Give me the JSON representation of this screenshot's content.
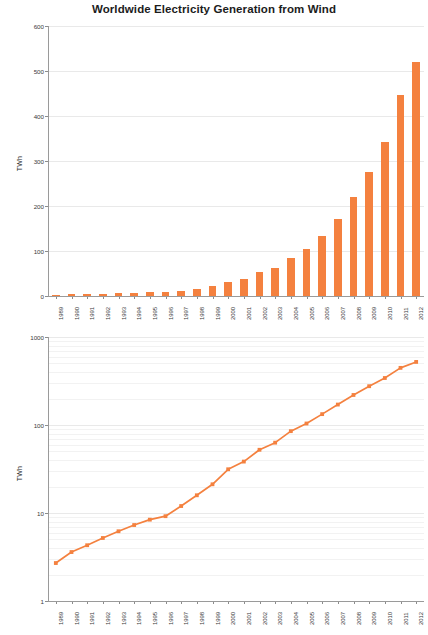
{
  "title": "Worldwide Electricity Generation from Wind",
  "colors": {
    "series": "#f4813f",
    "grid": "#e9e9e9",
    "axis": "#9a9a9a",
    "text": "#2a2a2a"
  },
  "chart_data": [
    {
      "type": "bar",
      "title": "Worldwide Electricity Generation from Wind",
      "xlabel": "",
      "ylabel": "TWh",
      "categories": [
        "1989",
        "1990",
        "1991",
        "1992",
        "1993",
        "1994",
        "1995",
        "1996",
        "1997",
        "1998",
        "1999",
        "2000",
        "2001",
        "2002",
        "2003",
        "2004",
        "2005",
        "2006",
        "2007",
        "2008",
        "2009",
        "2010",
        "2011",
        "2012"
      ],
      "values": [
        2.7,
        3.6,
        4.3,
        5.2,
        6.2,
        7.3,
        8.4,
        9.2,
        12.0,
        15.9,
        21.2,
        31.4,
        38.4,
        52.3,
        63.0,
        85.1,
        104.0,
        132.9,
        170.7,
        219.4,
        276.0,
        342.0,
        446.0,
        521.0
      ],
      "ylim": [
        0,
        600
      ],
      "yticks": [
        0,
        100,
        200,
        300,
        400,
        500,
        600
      ],
      "grid": true,
      "legend": "none",
      "yscale": "linear"
    },
    {
      "type": "line",
      "title": "",
      "xlabel": "",
      "ylabel": "TWh",
      "categories": [
        "1989",
        "1990",
        "1991",
        "1992",
        "1993",
        "1994",
        "1995",
        "1996",
        "1997",
        "1998",
        "1999",
        "2000",
        "2001",
        "2002",
        "2003",
        "2004",
        "2005",
        "2006",
        "2007",
        "2008",
        "2009",
        "2010",
        "2011",
        "2012"
      ],
      "values": [
        2.7,
        3.6,
        4.3,
        5.2,
        6.2,
        7.3,
        8.4,
        9.2,
        12.0,
        15.9,
        21.2,
        31.4,
        38.4,
        52.3,
        63.0,
        85.1,
        104.0,
        132.9,
        170.7,
        219.4,
        276.0,
        342.0,
        446.0,
        521.0
      ],
      "ylim": [
        1,
        1000
      ],
      "yticks": [
        1,
        10,
        100,
        1000
      ],
      "grid": true,
      "legend": "none",
      "yscale": "log",
      "markers": true
    }
  ],
  "top_chart": {
    "ylabel": "TWh",
    "ytick_labels": [
      "600",
      "500",
      "400",
      "300",
      "200",
      "100",
      "0"
    ]
  },
  "bottom_chart": {
    "ylabel": "TWh",
    "ytick_labels": [
      "1000",
      "100",
      "10",
      "1"
    ]
  }
}
